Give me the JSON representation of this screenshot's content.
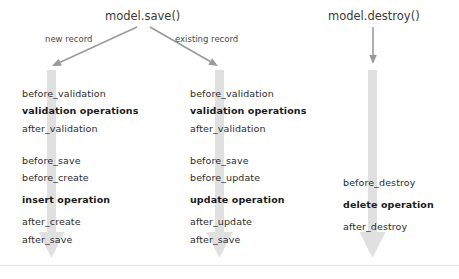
{
  "diagram": {
    "type": "activerecord-callbacks-flow",
    "background_color": "#ffffff",
    "arrow_color": "#9a9a9a",
    "bar_color": "#e0e0e0",
    "text_color": "#2b2b2b",
    "divider_color": "#e2e2e2"
  },
  "entrypoints": [
    {
      "id": "save",
      "label": "model.save()",
      "x": 105,
      "y": 10
    },
    {
      "id": "destroy",
      "label": "model.destroy()",
      "x": 328,
      "y": 10
    }
  ],
  "branch_labels": [
    {
      "id": "new-record",
      "label": "new record",
      "x": 45,
      "y": 34
    },
    {
      "id": "existing-record",
      "label": "existing record",
      "x": 175,
      "y": 34
    }
  ],
  "columns": [
    {
      "id": "create",
      "name": "new-record-create-flow",
      "text_x": 22,
      "bar_x": 47,
      "groups": [
        {
          "id": "validation",
          "items": [
            {
              "label": "before_validation",
              "bold": false,
              "y": 88
            },
            {
              "label": "validation operations",
              "bold": true,
              "y": 105
            },
            {
              "label": "after_validation",
              "bold": false,
              "y": 123
            }
          ]
        },
        {
          "id": "persistence",
          "items": [
            {
              "label": "before_save",
              "bold": false,
              "y": 155
            },
            {
              "label": "before_create",
              "bold": false,
              "y": 172
            },
            {
              "label": "insert operation",
              "bold": true,
              "y": 194
            },
            {
              "label": "after_create",
              "bold": false,
              "y": 216
            },
            {
              "label": "after_save",
              "bold": false,
              "y": 234
            }
          ]
        }
      ]
    },
    {
      "id": "update",
      "name": "existing-record-update-flow",
      "text_x": 190,
      "bar_x": 215,
      "groups": [
        {
          "id": "validation",
          "items": [
            {
              "label": "before_validation",
              "bold": false,
              "y": 88
            },
            {
              "label": "validation operations",
              "bold": true,
              "y": 105
            },
            {
              "label": "after_validation",
              "bold": false,
              "y": 123
            }
          ]
        },
        {
          "id": "persistence",
          "items": [
            {
              "label": "before_save",
              "bold": false,
              "y": 155
            },
            {
              "label": "before_update",
              "bold": false,
              "y": 172
            },
            {
              "label": "update operation",
              "bold": true,
              "y": 194
            },
            {
              "label": "after_update",
              "bold": false,
              "y": 216
            },
            {
              "label": "after_save",
              "bold": false,
              "y": 234
            }
          ]
        }
      ]
    },
    {
      "id": "destroy",
      "name": "destroy-flow",
      "text_x": 343,
      "bar_x": 368,
      "groups": [
        {
          "id": "destroy",
          "items": [
            {
              "label": "before_destroy",
              "bold": false,
              "y": 177
            },
            {
              "label": "delete operation",
              "bold": true,
              "y": 199
            },
            {
              "label": "after_destroy",
              "bold": false,
              "y": 221
            }
          ]
        }
      ]
    }
  ],
  "connectors": [
    {
      "id": "save-to-create",
      "from_label": "model.save()",
      "to_column": "create",
      "kind": "diagonal-arrow",
      "x1": 137,
      "y1": 27,
      "x2": 52,
      "y2": 66
    },
    {
      "id": "save-to-update",
      "from_label": "model.save()",
      "to_column": "update",
      "kind": "diagonal-arrow",
      "x1": 150,
      "y1": 27,
      "x2": 218,
      "y2": 66
    },
    {
      "id": "destroy-to-destroy",
      "from_label": "model.destroy()",
      "to_column": "destroy",
      "kind": "vertical-arrow",
      "x1": 373,
      "y1": 27,
      "x2": 373,
      "y2": 64
    }
  ],
  "flow_bars": [
    {
      "id": "create-bar",
      "x": 47,
      "top": 70,
      "bottom": 258,
      "width": 9
    },
    {
      "id": "update-bar",
      "x": 215,
      "top": 70,
      "bottom": 258,
      "width": 9
    },
    {
      "id": "destroy-bar",
      "x": 368,
      "top": 70,
      "bottom": 258,
      "width": 9
    }
  ]
}
